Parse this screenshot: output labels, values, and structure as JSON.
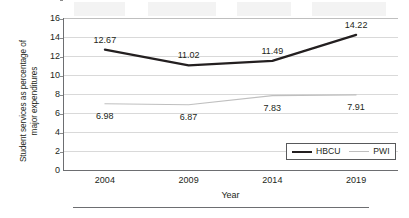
{
  "chart_data": {
    "type": "line",
    "title": "",
    "xlabel": "Year",
    "ylabel": "Student services as percentage of major expenditures",
    "ylabel_lines": [
      "Student services as percentage of",
      "major expenditures"
    ],
    "categories": [
      "2004",
      "2009",
      "2014",
      "2019"
    ],
    "ylim": [
      0,
      16
    ],
    "yticks": [
      "16",
      "14",
      "12",
      "10",
      "8",
      "6",
      "4",
      "2",
      "0"
    ],
    "ytick_values": [
      16,
      14,
      12,
      10,
      8,
      6,
      4,
      2,
      0
    ],
    "grid": "horizontal",
    "legend_position": "bottom-right",
    "series": [
      {
        "name": "HBCU",
        "values": [
          12.67,
          11.02,
          11.49,
          14.22
        ],
        "labels": [
          "12.67",
          "11.02",
          "11.49",
          "14.22"
        ],
        "color": "#231f20",
        "line_width": 2.2
      },
      {
        "name": "PWI",
        "values": [
          6.98,
          6.87,
          7.83,
          7.91
        ],
        "labels": [
          "6.98",
          "6.87",
          "7.83",
          "7.91"
        ],
        "color": "#bfbfbf",
        "line_width": 1.1
      }
    ],
    "colors": {
      "hbcu": "#231f20",
      "pwi": "#bfbfbf",
      "gridline": "#d9d9d9",
      "axis": "#6d6e71",
      "text": "#231f20",
      "background": "#ffffff"
    }
  },
  "legend": {
    "entries": [
      {
        "label": "HBCU"
      },
      {
        "label": "PWI"
      }
    ]
  }
}
